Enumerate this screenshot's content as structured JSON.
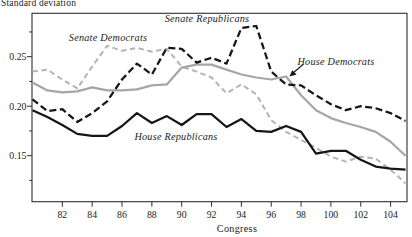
{
  "page": {
    "y_axis_title": "Standard deviation",
    "x_axis_title": "Congress"
  },
  "colors": {
    "black_line": "#161616",
    "gray_solid_line": "#a6a6a6",
    "gray_dashed_line": "#b4b4b4",
    "frame": "#2e2e2e",
    "text": "#1c1c1c"
  },
  "chart_data": {
    "type": "line",
    "title": "Standard deviation",
    "xlabel": "Congress",
    "ylabel": "Standard deviation",
    "xlim": [
      80,
      105.2
    ],
    "ylim": [
      0.103,
      0.294
    ],
    "grid": false,
    "legend": "inline-labels",
    "x": [
      80,
      81,
      82,
      83,
      84,
      85,
      86,
      87,
      88,
      89,
      90,
      91,
      92,
      93,
      94,
      95,
      96,
      97,
      98,
      99,
      100,
      101,
      102,
      103,
      104,
      105
    ],
    "x_ticks": [
      82,
      84,
      86,
      88,
      90,
      92,
      94,
      96,
      98,
      100,
      102,
      104
    ],
    "y_ticks": [
      {
        "v": 0.15,
        "label": "0.15"
      },
      {
        "v": 0.2,
        "label": "0.20"
      },
      {
        "v": 0.25,
        "label": "0.25"
      }
    ],
    "y_minor_ticks": [
      0.125,
      0.175,
      0.225,
      0.275
    ],
    "series": [
      {
        "name": "Senate Democrats",
        "style": "dashed",
        "color": "#b4b4b4",
        "values": [
          0.235,
          0.237,
          0.227,
          0.218,
          0.24,
          0.261,
          0.256,
          0.259,
          0.255,
          0.258,
          0.24,
          0.235,
          0.229,
          0.213,
          0.222,
          0.212,
          0.186,
          0.174,
          0.166,
          0.158,
          0.149,
          0.144,
          0.149,
          0.147,
          0.136,
          0.122
        ]
      },
      {
        "name": "House Democrats",
        "style": "solid",
        "color": "#a6a6a6",
        "values": [
          0.224,
          0.216,
          0.214,
          0.215,
          0.219,
          0.216,
          0.216,
          0.217,
          0.221,
          0.222,
          0.239,
          0.242,
          0.242,
          0.237,
          0.232,
          0.229,
          0.227,
          0.23,
          0.211,
          0.196,
          0.188,
          0.183,
          0.179,
          0.174,
          0.164,
          0.15
        ]
      },
      {
        "name": "Senate Republicans",
        "style": "dashed",
        "color": "#161616",
        "values": [
          0.207,
          0.195,
          0.197,
          0.184,
          0.193,
          0.205,
          0.227,
          0.243,
          0.232,
          0.259,
          0.258,
          0.244,
          0.249,
          0.243,
          0.279,
          0.281,
          0.235,
          0.222,
          0.221,
          0.211,
          0.202,
          0.196,
          0.2,
          0.198,
          0.193,
          0.185
        ]
      },
      {
        "name": "House Republicans",
        "style": "solid",
        "color": "#161616",
        "values": [
          0.196,
          0.189,
          0.181,
          0.172,
          0.17,
          0.17,
          0.18,
          0.193,
          0.183,
          0.19,
          0.181,
          0.192,
          0.192,
          0.179,
          0.187,
          0.175,
          0.174,
          0.18,
          0.174,
          0.152,
          0.155,
          0.155,
          0.146,
          0.139,
          0.137,
          0.136
        ]
      }
    ]
  }
}
